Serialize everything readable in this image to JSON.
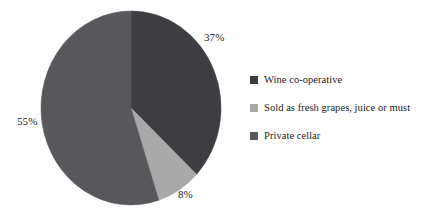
{
  "chart_data": {
    "type": "pie",
    "title": "",
    "subtitle": "",
    "xlabel": "",
    "ylabel": "",
    "grid": false,
    "legend_position": "right",
    "start_angle_deg": 0,
    "direction": "clockwise",
    "categories": [
      "Wine co-operative",
      "Sold as fresh grapes, juice or must",
      "Private cellar"
    ],
    "values": [
      37,
      8,
      55
    ],
    "unit": "%",
    "slices": [
      {
        "label": "Wine co-operative",
        "value": 37,
        "data_label": "37%",
        "color": "#3e3e42"
      },
      {
        "label": "Sold as fresh grapes, juice or must",
        "value": 8,
        "data_label": "8%",
        "color": "#a9a9a9"
      },
      {
        "label": "Private cellar",
        "value": 55,
        "data_label": "55%",
        "color": "#58585c"
      }
    ],
    "data_labels": [
      "37%",
      "8%",
      "55%"
    ]
  },
  "pie": {
    "label_37": "37%",
    "label_8": "8%",
    "label_55": "55%"
  },
  "legend": {
    "items": [
      {
        "label": "Wine co-operative",
        "color": "#3e3e42"
      },
      {
        "label": "Sold as fresh grapes, juice or must",
        "color": "#a9a9a9"
      },
      {
        "label": "Private cellar",
        "color": "#58585c"
      }
    ]
  },
  "colors": {
    "background": "#ffffff",
    "text": "#1b1b1b",
    "slice_wine_cooperative": "#3e3e42",
    "slice_fresh_grapes": "#a9a9a9",
    "slice_private_cellar": "#58585c"
  }
}
